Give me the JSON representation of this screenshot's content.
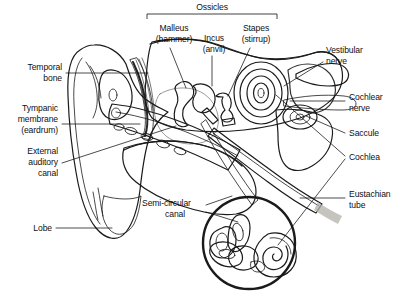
{
  "figure": {
    "background_color": "#ffffff",
    "ink_color": "#1a1a1a"
  },
  "bracket_group": {
    "label": "Ossicles",
    "members": [
      "Malleus (hammer)",
      "Incus (anvil)",
      "Stapes (stirrup)"
    ]
  },
  "labels": {
    "ossicles": "Ossicles",
    "malleus_1": "Malleus",
    "malleus_2": "(hammer)",
    "incus_1": "Incus",
    "incus_2": "(anvil)",
    "stapes_1": "Stapes",
    "stapes_2": "(stirrup)",
    "temporal_1": "Temporal",
    "temporal_2": "bone",
    "tympanic_1": "Tympanic",
    "tympanic_2": "membrane",
    "tympanic_3": "(eardrum)",
    "external_1": "External",
    "external_2": "auditory",
    "external_3": "canal",
    "lobe": "Lobe",
    "semicircular_1": "Semi-circular",
    "semicircular_2": "canal",
    "vestibular_1": "Vestibular",
    "vestibular_2": "nerve",
    "cochlear_1": "Cochlear",
    "cochlear_2": "nerve",
    "saccule": "Saccule",
    "cochlea": "Cochlea",
    "eustachian_1": "Eustachian",
    "eustachian_2": "tube"
  },
  "parts": {
    "outer_ear": "pinna-auricle",
    "ear_canal": "external-auditory-canal",
    "eardrum": "tympanic-membrane",
    "bone_texture": "temporal-bone-stipple",
    "mastoid": "mastoid-air-cells",
    "ossicle_chain": "malleus-incus-stapes",
    "spiral": "cochlea-spiral",
    "inset": "bony-labyrinth-inset"
  },
  "palette": {
    "bone_light": "#efeeea",
    "bone_mid": "#d9d7d0",
    "bone_dark": "#b9b6ad",
    "tissue": "#cfcdc6",
    "canal_fill": "#e8e7e3",
    "nerve": "#c9c7c0",
    "shadow": "#9a978e"
  }
}
